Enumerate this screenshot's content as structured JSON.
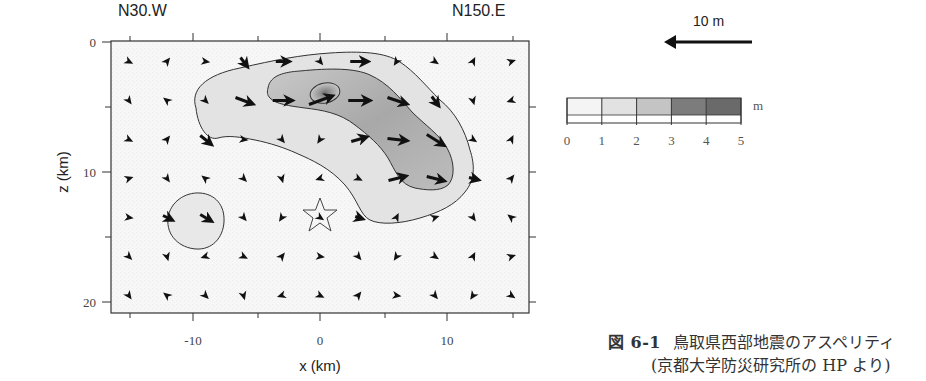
{
  "figure": {
    "direction_left": "N30.W",
    "direction_right": "N150.E",
    "scale_arrow_label": "10 m",
    "colorbar": {
      "unit": "m",
      "ticks": [
        "0",
        "1",
        "2",
        "3",
        "4",
        "5"
      ],
      "shades": [
        "#f4f4f4",
        "#e2e2e2",
        "#c4c4c4",
        "#7c7c7c",
        "#6a6a6a"
      ]
    },
    "caption": {
      "number": "図 6-1",
      "line1": "鳥取県西部地震のアスペリティ",
      "line2": "(京都大学防災研究所の HP より)"
    }
  },
  "chart_data": {
    "type": "heatmap",
    "title": "",
    "subtitle": "Fault slip distribution (asperity) with slip vectors",
    "xlabel": "x (km)",
    "ylabel": "z (km)",
    "xlim": [
      -16.5,
      16.5
    ],
    "ylim": [
      21,
      0
    ],
    "x_ticks": [
      -10,
      0,
      10
    ],
    "x_tick_labels": [
      "-10",
      "0",
      "10"
    ],
    "x_minor_ticks": [
      -15,
      -5,
      5,
      15
    ],
    "y_ticks": [
      0,
      10,
      20
    ],
    "y_tick_labels": [
      "0",
      "10",
      "20"
    ],
    "y_minor_ticks": [
      5,
      15
    ],
    "grid": false,
    "colorbar": {
      "label": "m",
      "range": [
        0,
        5
      ],
      "ticks": [
        0,
        1,
        2,
        3,
        4,
        5
      ]
    },
    "annotations": [
      "N30.W",
      "N150.E",
      "10 m (scale arrow)",
      "star = hypocenter at (0, 13.5)"
    ],
    "contours": [
      {
        "level": 1,
        "description": "outer contour of main asperity, from (-9, 7) through (-3, 1.5) to (12, 10) and down to (4, 13.5)"
      },
      {
        "level": 2,
        "description": "inner contour of main asperity, from (-2, 3) to (9, 11)"
      },
      {
        "level": 3,
        "description": "peak contour around (0.5, 4)"
      },
      {
        "level": 1,
        "description": "small secondary patch centered near (-10, 13.5)"
      }
    ],
    "hypocenter": {
      "x": 0,
      "z": 13.5
    },
    "peak_slip_m": 4.2,
    "slip_vectors_grid": {
      "x": [
        -15,
        -12,
        -9,
        -6,
        -3,
        0,
        3,
        6,
        9,
        12,
        15
      ],
      "z": [
        1.5,
        4.5,
        7.5,
        10.5,
        13.5,
        16.5,
        19.5
      ],
      "description": "Rake arrows; long arrows within the asperity (rake ~ toward +x, slightly down), short arrowheads elsewhere"
    }
  }
}
